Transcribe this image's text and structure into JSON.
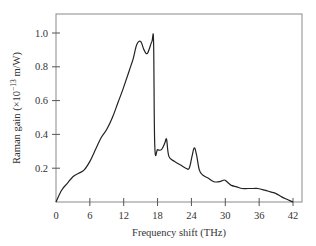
{
  "chart_data": {
    "type": "line",
    "title": "",
    "xlabel": "Frequency shift (THz)",
    "ylabel": "Raman gain (×10⁻¹³ m/W)",
    "ylabel_parts": {
      "main": "Raman gain (×10",
      "exp": "−13",
      "tail": " m/W)"
    },
    "xlim": [
      0,
      42
    ],
    "ylim": [
      0,
      1.1
    ],
    "xticks": [
      0,
      6,
      12,
      18,
      24,
      30,
      36,
      42
    ],
    "yticks": [
      0.2,
      0.4,
      0.6,
      0.8,
      1.0
    ],
    "xtick_labels": [
      "0",
      "6",
      "12",
      "18",
      "24",
      "30",
      "36",
      "42"
    ],
    "ytick_labels": [
      "0.2",
      "0.4",
      "0.6",
      "0.8",
      "1.0"
    ],
    "grid": false,
    "legend": null,
    "series": [
      {
        "name": "Raman gain spectrum",
        "color": "#222222",
        "x": [
          0,
          1,
          2,
          3,
          4,
          5,
          6,
          7,
          8,
          9,
          10,
          11,
          12,
          13,
          13.7,
          14.3,
          15,
          15.6,
          16.2,
          17,
          17.3,
          17.5,
          18,
          18.7,
          19.3,
          19.6,
          20,
          21,
          22,
          23,
          23.6,
          24.1,
          24.5,
          24.9,
          25.4,
          26,
          27,
          28,
          29,
          29.8,
          30.3,
          31,
          32,
          33,
          34,
          35,
          35.8,
          37,
          38,
          39,
          40,
          41,
          42
        ],
        "y": [
          0,
          0.07,
          0.11,
          0.15,
          0.17,
          0.19,
          0.24,
          0.31,
          0.38,
          0.43,
          0.5,
          0.59,
          0.68,
          0.78,
          0.85,
          0.93,
          0.95,
          0.9,
          0.88,
          0.95,
          0.94,
          0.33,
          0.31,
          0.31,
          0.35,
          0.37,
          0.27,
          0.24,
          0.22,
          0.2,
          0.2,
          0.27,
          0.32,
          0.28,
          0.19,
          0.16,
          0.14,
          0.12,
          0.12,
          0.13,
          0.12,
          0.1,
          0.09,
          0.08,
          0.08,
          0.08,
          0.08,
          0.07,
          0.06,
          0.05,
          0.03,
          0.015,
          0
        ]
      }
    ]
  }
}
